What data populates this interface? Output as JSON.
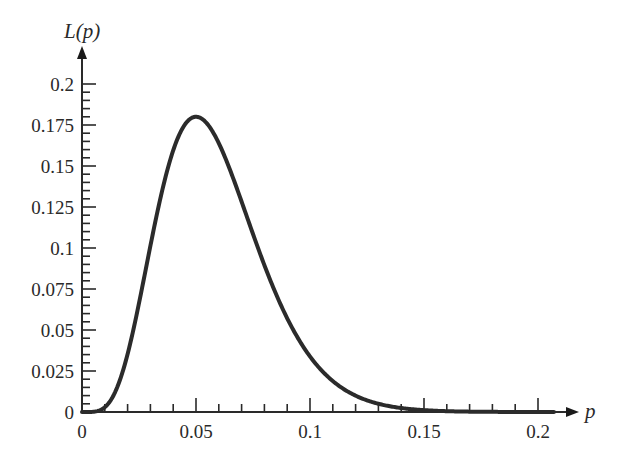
{
  "chart_data": {
    "type": "line",
    "title": "",
    "xlabel": "p",
    "ylabel": "L(p)",
    "xlim": [
      0,
      0.207
    ],
    "ylim": [
      0,
      0.2
    ],
    "grid": false,
    "legend": null,
    "x_ticks": [
      "0",
      "0.05",
      "0.1",
      "0.15",
      "0.2"
    ],
    "y_ticks": [
      "0",
      "0.025",
      "0.05",
      "0.075",
      "0.1",
      "0.125",
      "0.15",
      "0.175",
      "0.2"
    ],
    "x_minor_step": 0.01,
    "y_minor_step": 0.005,
    "series": [
      {
        "name": "L(p)",
        "x": [
          0,
          0.01,
          0.02,
          0.03,
          0.04,
          0.05,
          0.06,
          0.07,
          0.08,
          0.09,
          0.1,
          0.11,
          0.12,
          0.13,
          0.14,
          0.15,
          0.16,
          0.17,
          0.18,
          0.19,
          0.2
        ],
        "values": [
          0,
          0.0029,
          0.0353,
          0.1013,
          0.1576,
          0.18,
          0.1639,
          0.1264,
          0.0855,
          0.052,
          0.0339,
          0.0196,
          0.0102,
          0.0048,
          0.0021,
          0.0008,
          0.0003,
          0.0001,
          0.0,
          0.0,
          0.0
        ]
      }
    ],
    "annotations": []
  },
  "axes": {
    "x_label": "p",
    "y_label": "L(p)"
  }
}
